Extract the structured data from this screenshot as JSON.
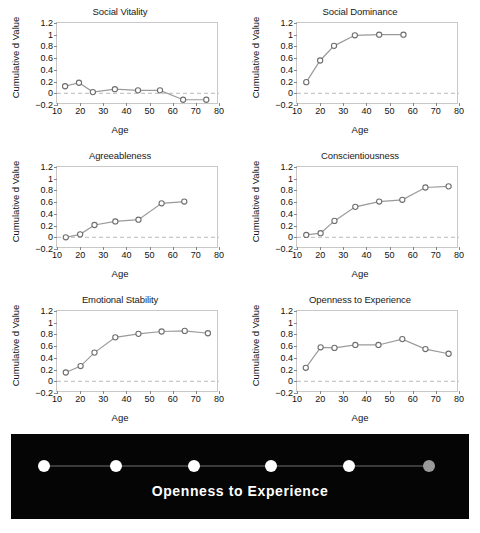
{
  "figure": {
    "layout": "2-column grid of six line charts above a dark inset panel",
    "columns": 2,
    "rows": 3
  },
  "dark_panel": {
    "caption": "Openness to Experience",
    "background_color": "#050505",
    "dot_color": "#ffffff",
    "last_dot_color": "#9a9a9a",
    "line_color": "#3a3a3a",
    "dots": [
      {
        "x": 33,
        "y": 32,
        "r": 6.0,
        "color": "#ffffff"
      },
      {
        "x": 105,
        "y": 32,
        "r": 6.0,
        "color": "#ffffff"
      },
      {
        "x": 183,
        "y": 32,
        "r": 6.0,
        "color": "#ffffff"
      },
      {
        "x": 260,
        "y": 32,
        "r": 6.0,
        "color": "#ffffff"
      },
      {
        "x": 338,
        "y": 32,
        "r": 6.0,
        "color": "#ffffff"
      },
      {
        "x": 418,
        "y": 32,
        "r": 6.0,
        "color": "#9a9a9a"
      }
    ]
  },
  "common": {
    "xlabel": "Age",
    "ylabel": "Cumulative d Value",
    "xlim": [
      10,
      80
    ],
    "ylim": [
      -0.2,
      1.2
    ],
    "xticks": [
      10,
      20,
      30,
      40,
      50,
      60,
      70,
      80
    ],
    "yticks": [
      -0.2,
      0,
      0.2,
      0.4,
      0.6,
      0.8,
      1,
      1.2
    ],
    "ytick_labels": [
      "−0.2",
      "0",
      "0.2",
      "0.4",
      "0.6",
      "0.8",
      "1",
      "1.2"
    ],
    "zero_reference": 0,
    "grid": false,
    "legend": "none",
    "line_color": "#9a9a9a",
    "marker_edge_color": "#6e6e6e",
    "marker_face_color": "#ffffff",
    "zero_line_color": "#b9b9b9"
  },
  "chart_data": [
    {
      "type": "line",
      "title": "Social Vitality",
      "xlabel": "Age",
      "ylabel": "Cumulative d Value",
      "xlim": [
        10,
        80
      ],
      "ylim": [
        -0.2,
        1.2
      ],
      "x": [
        13.5,
        19.5,
        25.5,
        35,
        45,
        54.5,
        64.5,
        74.5
      ],
      "values": [
        0.12,
        0.18,
        0.02,
        0.07,
        0.05,
        0.05,
        -0.11,
        -0.11
      ]
    },
    {
      "type": "line",
      "title": "Social Dominance",
      "xlabel": "Age",
      "ylabel": "Cumulative d Value",
      "xlim": [
        10,
        80
      ],
      "ylim": [
        -0.2,
        1.2
      ],
      "x": [
        14,
        20,
        26,
        35,
        45.5,
        56
      ],
      "values": [
        0.19,
        0.56,
        0.81,
        0.99,
        1.0,
        1.0
      ]
    },
    {
      "type": "line",
      "title": "Agreeableness",
      "xlabel": "Age",
      "ylabel": "Cumulative d Value",
      "xlim": [
        10,
        80
      ],
      "ylim": [
        -0.2,
        1.2
      ],
      "x": [
        13.8,
        20,
        26.2,
        35.2,
        45.2,
        55.2,
        65
      ],
      "values": [
        0.0,
        0.05,
        0.21,
        0.27,
        0.3,
        0.58,
        0.61
      ]
    },
    {
      "type": "line",
      "title": "Conscientiousness",
      "xlabel": "Age",
      "ylabel": "Cumulative d Value",
      "xlim": [
        10,
        80
      ],
      "ylim": [
        -0.2,
        1.2
      ],
      "x": [
        14,
        20.2,
        26.2,
        35.2,
        45.5,
        55.5,
        65.5,
        75.5
      ],
      "values": [
        0.04,
        0.07,
        0.28,
        0.52,
        0.61,
        0.64,
        0.85,
        0.87
      ]
    },
    {
      "type": "line",
      "title": "Emotional Stability",
      "xlabel": "Age",
      "ylabel": "Cumulative d Value",
      "xlim": [
        10,
        80
      ],
      "ylim": [
        -0.2,
        1.2
      ],
      "x": [
        13.8,
        20.2,
        26.2,
        35.2,
        45.2,
        55.2,
        65.2,
        75.2
      ],
      "values": [
        0.15,
        0.26,
        0.49,
        0.75,
        0.81,
        0.85,
        0.86,
        0.82
      ]
    },
    {
      "type": "line",
      "title": "Openness to Experience",
      "xlabel": "Age",
      "ylabel": "Cumulative d Value",
      "xlim": [
        10,
        80
      ],
      "ylim": [
        -0.2,
        1.2
      ],
      "x": [
        13.8,
        20.2,
        26.2,
        35.2,
        45.2,
        55.5,
        65.5,
        75.5
      ],
      "values": [
        0.23,
        0.58,
        0.57,
        0.62,
        0.62,
        0.72,
        0.55,
        0.47
      ]
    }
  ]
}
